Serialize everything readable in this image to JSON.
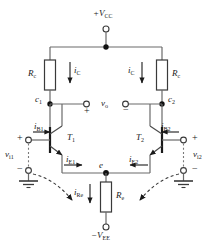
{
  "diagram": {
    "colors": {
      "wire": "#4a4a4a",
      "node": "#111111",
      "text": "#1a1a1a",
      "dashed": "#6b6b6b",
      "background": "#ffffff"
    }
  },
  "supplies": {
    "positive": {
      "label": "+V",
      "sub": "CC"
    },
    "negative": {
      "label": "−V",
      "sub": "EE"
    }
  },
  "resistors": {
    "collector_left": {
      "label": "R",
      "sub": "c"
    },
    "collector_right": {
      "label": "R",
      "sub": "c"
    },
    "emitter": {
      "label": "R",
      "sub": "e"
    }
  },
  "transistors": {
    "left": {
      "label": "T",
      "sub": "1"
    },
    "right": {
      "label": "T",
      "sub": "2"
    }
  },
  "nodes": {
    "collector_left": {
      "label": "c",
      "sub": "1"
    },
    "collector_right": {
      "label": "c",
      "sub": "2"
    },
    "emitter": {
      "label": "e",
      "sub": ""
    }
  },
  "currents": {
    "ic_left": {
      "label": "i",
      "sub": "C"
    },
    "ic_right": {
      "label": "i",
      "sub": "C"
    },
    "ib_left": {
      "label": "i",
      "sub": "B1"
    },
    "ib_right": {
      "label": "i",
      "sub": "B2"
    },
    "ie_left": {
      "label": "i",
      "sub": "E1"
    },
    "ie_right": {
      "label": "i",
      "sub": "E2"
    },
    "ire": {
      "label": "i",
      "sub": "Re"
    }
  },
  "voltages": {
    "output": {
      "label": "v",
      "sub": "o"
    },
    "input_left": {
      "label": "v",
      "sub": "i1"
    },
    "input_right": {
      "label": "v",
      "sub": "i2"
    }
  },
  "polarity": {
    "plus": "+",
    "minus": "−"
  }
}
